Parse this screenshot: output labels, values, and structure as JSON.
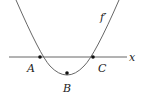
{
  "diagram": {
    "function_label": "f′",
    "axis_label": "x",
    "points": [
      {
        "label": "A",
        "desc": "root of f'"
      },
      {
        "label": "B",
        "desc": "minimum of f'"
      },
      {
        "label": "C",
        "desc": "root of f'"
      }
    ],
    "colors": {
      "curve": "#555555",
      "axis": "#555555",
      "point": "#111111",
      "text": "#222222"
    }
  }
}
